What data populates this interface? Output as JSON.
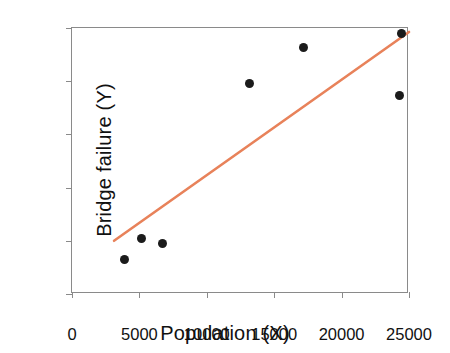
{
  "chart_data": {
    "type": "scatter",
    "title": "",
    "xlabel": "Population (X)",
    "ylabel": "Bridge failure (Y)",
    "xlim": [
      0,
      25000
    ],
    "ylim": [
      0,
      100
    ],
    "xticks": [
      "0",
      "5000",
      "10000",
      "15000",
      "20000",
      "25000"
    ],
    "xtick_values": [
      0,
      5000,
      10000,
      15000,
      20000,
      25000
    ],
    "yticks": [
      "0",
      "20",
      "40",
      "60",
      "80",
      "100"
    ],
    "ytick_values": [
      0,
      20,
      40,
      60,
      80,
      100
    ],
    "grid": false,
    "legend": null,
    "series": [
      {
        "name": "observations",
        "marker": "filled-circle",
        "color": "#1b1b1b",
        "x": [
          3860,
          5120,
          6680,
          13200,
          17200,
          24300,
          24450
        ],
        "y": [
          13,
          21,
          19,
          79,
          92.5,
          74.5,
          98
        ]
      },
      {
        "name": "fitted regression line",
        "type": "line",
        "color": "#e8825a",
        "x": [
          3120,
          25000
        ],
        "y": [
          20,
          98.5
        ]
      }
    ],
    "points": [
      {
        "x": 3860,
        "y": 13
      },
      {
        "x": 5120,
        "y": 21
      },
      {
        "x": 6680,
        "y": 19
      },
      {
        "x": 13200,
        "y": 79
      },
      {
        "x": 17200,
        "y": 92.5
      },
      {
        "x": 24300,
        "y": 74.5
      },
      {
        "x": 24450,
        "y": 98
      }
    ],
    "colors": {
      "axis": "#8a8a8a",
      "text": "#111111",
      "marker": "#1b1b1b",
      "trend_line": "#e8825a",
      "background": "#ffffff"
    }
  }
}
